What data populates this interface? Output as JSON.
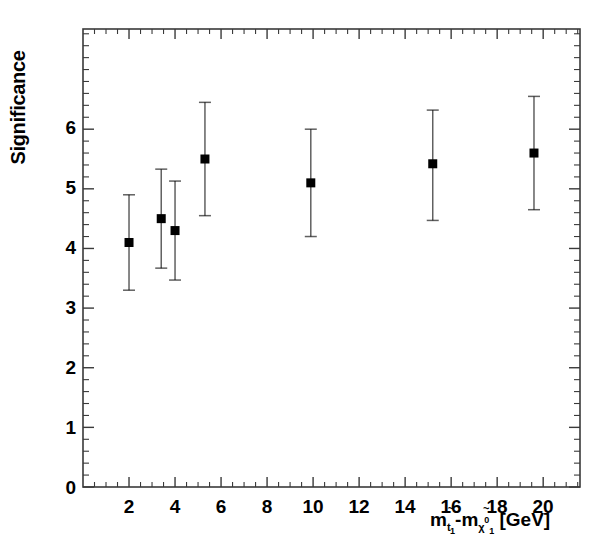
{
  "chart_data": {
    "type": "scatter",
    "title": "",
    "xlabel": "m_t1 - m_chi01 [GeV]",
    "ylabel": "Significance",
    "xlim": [
      0,
      21.6
    ],
    "ylim": [
      0,
      7.68
    ],
    "grid": false,
    "legend": "none",
    "x_ticks": [
      2,
      4,
      6,
      8,
      10,
      12,
      14,
      16,
      18,
      20
    ],
    "y_ticks": [
      0,
      1,
      2,
      3,
      4,
      5,
      6
    ],
    "x_minor_step": 0.5,
    "y_minor_step": 0.2,
    "marker": "filled-square",
    "marker_color": "#000000",
    "errorbar_color": "#000000",
    "x": [
      2.0,
      3.4,
      4.0,
      5.3,
      9.9,
      15.2,
      19.6
    ],
    "values": [
      4.1,
      4.5,
      4.3,
      5.5,
      5.1,
      5.42,
      5.6
    ],
    "y_err_low": [
      0.8,
      0.83,
      0.83,
      0.95,
      0.9,
      0.95,
      0.95
    ],
    "y_err_high": [
      0.8,
      0.83,
      0.83,
      0.95,
      0.9,
      0.9,
      0.95
    ],
    "points": [
      {
        "x": 2.0,
        "y": 4.1,
        "lo": 3.3,
        "hi": 4.9
      },
      {
        "x": 3.4,
        "y": 4.5,
        "lo": 3.67,
        "hi": 5.33
      },
      {
        "x": 4.0,
        "y": 4.3,
        "lo": 3.47,
        "hi": 5.13
      },
      {
        "x": 5.3,
        "y": 5.5,
        "lo": 4.55,
        "hi": 6.45
      },
      {
        "x": 9.9,
        "y": 5.1,
        "lo": 4.2,
        "hi": 6.0
      },
      {
        "x": 15.2,
        "y": 5.42,
        "lo": 4.47,
        "hi": 6.32
      },
      {
        "x": 19.6,
        "y": 5.6,
        "lo": 4.65,
        "hi": 6.55
      }
    ]
  },
  "axis": {
    "y_label": "Significance",
    "y_tick_labels": [
      "0",
      "1",
      "2",
      "3",
      "4",
      "5",
      "6"
    ],
    "x_tick_labels": [
      "2",
      "4",
      "6",
      "8",
      "10",
      "12",
      "14",
      "16",
      "18",
      "20"
    ],
    "x_label_parts": {
      "m1": "m",
      "m1_sub": "t",
      "m1_subsub": "1",
      "minus": "-",
      "m2": "m",
      "m2_sub": "χ",
      "m2_sup": "0",
      "m2_subsub": "1",
      "unit": "[GeV]",
      "tilde": "~"
    }
  },
  "style": {
    "frame_color": "#3a3a3a",
    "background": "#ffffff",
    "marker_color": "#000000"
  }
}
